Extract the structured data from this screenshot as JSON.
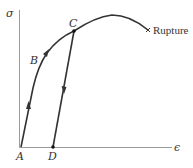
{
  "diagram": {
    "type": "stress-strain-curve",
    "axes": {
      "y_label": "σ",
      "x_label": "ϵ"
    },
    "points": {
      "A": {
        "label": "A"
      },
      "B": {
        "label": "B"
      },
      "C": {
        "label": "C"
      },
      "D": {
        "label": "D"
      }
    },
    "rupture_label": "Rupture",
    "colors": {
      "curve": "#333333",
      "axis": "#999999",
      "text": "#333333"
    },
    "paths": [
      {
        "from": "A",
        "to": "B",
        "direction": "loading"
      },
      {
        "from": "B",
        "to": "C",
        "direction": "loading"
      },
      {
        "from": "C",
        "to": "Rupture",
        "direction": "loading"
      },
      {
        "from": "C",
        "to": "D",
        "direction": "unloading"
      }
    ]
  }
}
